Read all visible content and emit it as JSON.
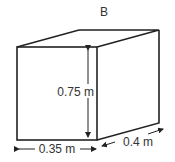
{
  "diagram": {
    "title": "B",
    "shape": "rectangular box (cuboid)",
    "dimensions": {
      "height": {
        "value": "0.75",
        "unit": "m"
      },
      "width": {
        "value": "0.35",
        "unit": "m"
      },
      "depth": {
        "value": "0.4",
        "unit": "m"
      }
    },
    "labels": {
      "height_label": "0.75 m",
      "width_label": "0.35 m",
      "depth_label": "0.4 m"
    },
    "colors": {
      "line": "#222222",
      "background": "#ffffff"
    }
  }
}
